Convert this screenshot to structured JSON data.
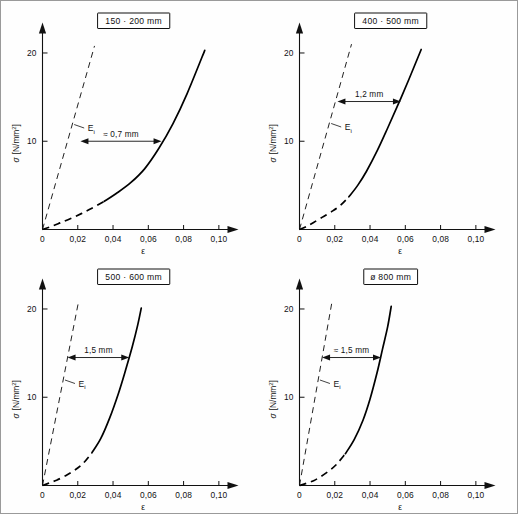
{
  "figure": {
    "panel_count": 4,
    "axis_labels": {
      "x": "ε",
      "y_symbol": "σ",
      "y_unit_open": "[N/mm",
      "y_unit_sup": "2",
      "y_unit_close": "]"
    },
    "x_ticks": [
      "0",
      "0,02",
      "0,04",
      "0,06",
      "0,08",
      "0,10"
    ],
    "x_tick_values": [
      0,
      0.02,
      0.04,
      0.06,
      0.08,
      0.1
    ],
    "y_ticks": [
      "10",
      "20"
    ],
    "y_tick_values": [
      10,
      20
    ],
    "tangent_legend": "E",
    "tangent_legend_sub": "i"
  },
  "chart_data": [
    {
      "type": "line",
      "panel": 0,
      "title": "150 · 200 mm",
      "xlabel": "ε",
      "ylabel": "σ [N/mm²]",
      "xlim": [
        0,
        0.11
      ],
      "ylim": [
        0,
        23
      ],
      "grid": false,
      "legend": "Eᵢ",
      "annotation": "≈ 0,7 mm",
      "annotation_at_sigma": 10,
      "annotation_from_x": 0.0215,
      "annotation_to_x": 0.0675,
      "series": [
        {
          "name": "stress-strain curve",
          "style": "solid-with-dashed-lower-part",
          "x": [
            0.0,
            0.005,
            0.01,
            0.016,
            0.022,
            0.028,
            0.035,
            0.042,
            0.05,
            0.058,
            0.066,
            0.074,
            0.082,
            0.092
          ],
          "y": [
            0.0,
            0.35,
            0.75,
            1.25,
            1.8,
            2.4,
            3.2,
            4.1,
            5.3,
            6.9,
            9.2,
            12.0,
            15.4,
            20.3
          ]
        },
        {
          "name": "initial tangent modulus Ei",
          "style": "dashed",
          "x": [
            0.0,
            0.0295
          ],
          "y": [
            0.0,
            20.8
          ]
        }
      ]
    },
    {
      "type": "line",
      "panel": 1,
      "title": "400 · 500 mm",
      "xlabel": "ε",
      "ylabel": "σ [N/mm²]",
      "xlim": [
        0,
        0.11
      ],
      "ylim": [
        0,
        23
      ],
      "grid": false,
      "legend": "Eᵢ",
      "annotation": "1,2 mm",
      "annotation_at_sigma": 14.5,
      "annotation_from_x": 0.0215,
      "annotation_to_x": 0.0575,
      "series": [
        {
          "name": "stress-strain curve",
          "style": "solid-with-dashed-lower-part",
          "x": [
            0.0,
            0.004,
            0.008,
            0.013,
            0.018,
            0.023,
            0.028,
            0.033,
            0.038,
            0.044,
            0.05,
            0.056,
            0.062,
            0.069
          ],
          "y": [
            0.0,
            0.35,
            0.8,
            1.4,
            2.0,
            2.7,
            3.7,
            5.0,
            6.6,
            8.9,
            11.5,
            14.2,
            17.0,
            20.4
          ]
        },
        {
          "name": "initial tangent modulus Ei",
          "style": "dashed",
          "x": [
            0.0,
            0.0295
          ],
          "y": [
            0.0,
            21.0
          ]
        }
      ]
    },
    {
      "type": "line",
      "panel": 2,
      "title": "500 · 600 mm",
      "xlabel": "ε",
      "ylabel": "σ [N/mm²]",
      "xlim": [
        0,
        0.11
      ],
      "ylim": [
        0,
        23
      ],
      "grid": false,
      "legend": "Eᵢ",
      "annotation": "1,5 mm",
      "annotation_at_sigma": 14.5,
      "annotation_from_x": 0.0142,
      "annotation_to_x": 0.0492,
      "series": [
        {
          "name": "stress-strain curve",
          "style": "solid-with-dashed-lower-part",
          "x": [
            0.0,
            0.004,
            0.008,
            0.013,
            0.018,
            0.023,
            0.028,
            0.033,
            0.038,
            0.043,
            0.047,
            0.051,
            0.054,
            0.056
          ],
          "y": [
            0.0,
            0.3,
            0.6,
            1.1,
            1.7,
            2.5,
            3.7,
            5.3,
            7.6,
            10.4,
            13.0,
            15.8,
            18.2,
            20.1
          ]
        },
        {
          "name": "initial tangent modulus Ei",
          "style": "dashed",
          "x": [
            0.0,
            0.0205
          ],
          "y": [
            0.0,
            20.9
          ]
        }
      ]
    },
    {
      "type": "line",
      "panel": 3,
      "title": "ø 800 mm",
      "xlabel": "ε",
      "ylabel": "σ [N/mm²]",
      "xlim": [
        0,
        0.11
      ],
      "ylim": [
        0,
        23
      ],
      "grid": false,
      "legend": "Eᵢ",
      "annotation": "≈ 1,5 mm",
      "annotation_at_sigma": 14.5,
      "annotation_from_x": 0.0128,
      "annotation_to_x": 0.0462,
      "series": [
        {
          "name": "stress-strain curve",
          "style": "solid-with-dashed-lower-part",
          "x": [
            0.0,
            0.004,
            0.008,
            0.012,
            0.017,
            0.021,
            0.026,
            0.031,
            0.036,
            0.04,
            0.044,
            0.047,
            0.05,
            0.052
          ],
          "y": [
            0.0,
            0.25,
            0.55,
            1.0,
            1.7,
            2.4,
            3.6,
            5.2,
            7.4,
            9.8,
            12.8,
            15.4,
            18.0,
            20.3
          ]
        },
        {
          "name": "initial tangent modulus Ei",
          "style": "dashed",
          "x": [
            0.0,
            0.0185
          ],
          "y": [
            0.0,
            20.9
          ]
        }
      ]
    }
  ]
}
